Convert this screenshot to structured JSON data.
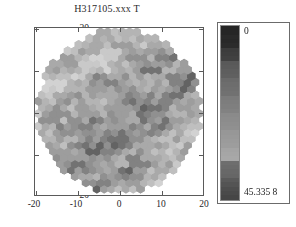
{
  "figure": {
    "title": "H317105.xxx T",
    "background_color": "#ffffff"
  },
  "axes": {
    "x_ticks": [
      "-20",
      "-10",
      "0",
      "10",
      "20"
    ],
    "y_ticks": [
      "20",
      "10",
      "0",
      "-10",
      "-20"
    ],
    "xlabel": "",
    "ylabel": "",
    "frame_color": "#5a5a5a"
  },
  "colorbar": {
    "top_label": "0",
    "bottom_label": "45.335 8",
    "orientation": "vertical",
    "frame_color": "#6b6b6b",
    "bands": [
      "#252525",
      "#262626",
      "#2a2a2a",
      "#282828",
      "#2b2b2b",
      "#3c3c3c",
      "#3e3e3e",
      "#414141",
      "#595959",
      "#5b5b5b",
      "#5e5e5e",
      "#606060",
      "#6a6a6a",
      "#6d6d6d",
      "#6f6f6f",
      "#717171",
      "#7b7b7b",
      "#7d7d7d",
      "#7f7f7f",
      "#828282",
      "#8a8a8a",
      "#8c8c8c",
      "#8e8e8e",
      "#909090",
      "#979797",
      "#999999",
      "#9b9b9b",
      "#9d9d9d",
      "#a4a4a4",
      "#a6a6a6",
      "#a8a8a8",
      "#6e6e6e",
      "#6b6b6b",
      "#686868",
      "#666666",
      "#5a5a5a",
      "#545454",
      "#4e4e4e",
      "#4a4a4a",
      "#464646"
    ]
  },
  "chart_data": {
    "type": "heatmap",
    "subtype": "hexagonal-binned-disk",
    "title": "H317105.xxx T",
    "xlabel": "",
    "ylabel": "",
    "xlim": [
      -21,
      21
    ],
    "ylim": [
      -21,
      21
    ],
    "xticks": [
      -20,
      -10,
      0,
      10,
      20
    ],
    "yticks": [
      -20,
      -10,
      0,
      10,
      20
    ],
    "grid": false,
    "legend": "colorbar-right",
    "colormap": "grayscale",
    "value_range": [
      0,
      45.3358
    ],
    "value_min_label": "0",
    "value_max_label": "45.335 8",
    "disk_radius_units": 20.5,
    "hex_radius_units": 1.05,
    "hex_count_approx": 380
  }
}
